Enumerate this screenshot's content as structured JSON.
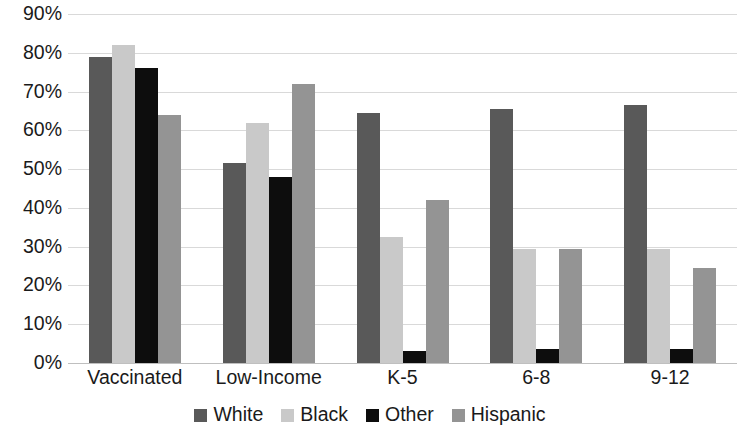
{
  "chart_data": {
    "type": "bar",
    "title": "",
    "subtitle": "",
    "xlabel": "",
    "ylabel": "",
    "ylim": [
      0,
      90
    ],
    "y_tick_labels": [
      "0%",
      "10%",
      "20%",
      "30%",
      "40%",
      "50%",
      "60%",
      "70%",
      "80%",
      "90%"
    ],
    "y_ticks": [
      0,
      10,
      20,
      30,
      40,
      50,
      60,
      70,
      80,
      90
    ],
    "grid": "horizontal",
    "legend_position": "bottom",
    "categories": [
      "Vaccinated",
      "Low-Income",
      "K-5",
      "6-8",
      "9-12"
    ],
    "series": [
      {
        "name": "White",
        "color": "#595959",
        "values": [
          79,
          51.5,
          64.5,
          65.5,
          66.5
        ]
      },
      {
        "name": "Black",
        "color": "#c9c9c9",
        "values": [
          82,
          62,
          32.5,
          29.5,
          29.5
        ]
      },
      {
        "name": "Other",
        "color": "#0d0d0d",
        "values": [
          76,
          48,
          3,
          3.5,
          3.5
        ]
      },
      {
        "name": "Hispanic",
        "color": "#949494",
        "values": [
          64,
          72,
          42,
          29.5,
          24.5
        ]
      }
    ]
  },
  "axis": {
    "gridline_color": "#d9d9d9",
    "baseline_color": "#bfbfbf",
    "text_color": "#1a1a1a"
  }
}
